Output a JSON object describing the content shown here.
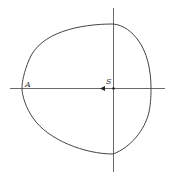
{
  "diagram": {
    "labels": {
      "point_a": "A",
      "point_s": "S"
    },
    "colors": {
      "line": "#333333",
      "background": "#ffffff"
    }
  }
}
